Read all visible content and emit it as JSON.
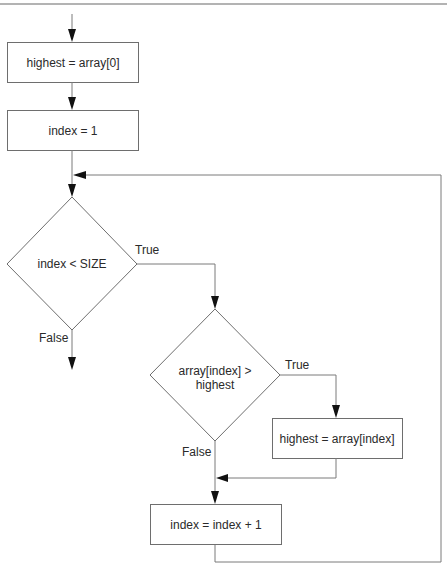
{
  "diagram": {
    "type": "flowchart",
    "title_rule": true,
    "nodes": {
      "init_highest": {
        "shape": "process",
        "label": "highest = array[0]"
      },
      "init_index": {
        "shape": "process",
        "label": "index = 1"
      },
      "cond_loop": {
        "shape": "decision",
        "label": "index < SIZE"
      },
      "cond_compare": {
        "shape": "decision",
        "label_line1": "array[index] >",
        "label_line2": "highest"
      },
      "assign_highest": {
        "shape": "process",
        "label": "highest = array[index]"
      },
      "increment": {
        "shape": "process",
        "label": "index = index + 1"
      }
    },
    "edge_labels": {
      "loop_true": "True",
      "loop_false": "False",
      "compare_true": "True",
      "compare_false": "False"
    },
    "edges": [
      {
        "from": "start",
        "to": "init_highest"
      },
      {
        "from": "init_highest",
        "to": "init_index"
      },
      {
        "from": "init_index",
        "to": "cond_loop"
      },
      {
        "from": "cond_loop",
        "to": "cond_compare",
        "label": "True"
      },
      {
        "from": "cond_loop",
        "to": "exit",
        "label": "False"
      },
      {
        "from": "cond_compare",
        "to": "assign_highest",
        "label": "True"
      },
      {
        "from": "cond_compare",
        "to": "increment",
        "label": "False"
      },
      {
        "from": "assign_highest",
        "to": "increment"
      },
      {
        "from": "increment",
        "to": "cond_loop",
        "note": "loop back"
      }
    ],
    "colors": {
      "stroke": "#6e6e6e",
      "arrowhead": "#111111",
      "text": "#2a2a2a",
      "background": "#ffffff"
    }
  }
}
